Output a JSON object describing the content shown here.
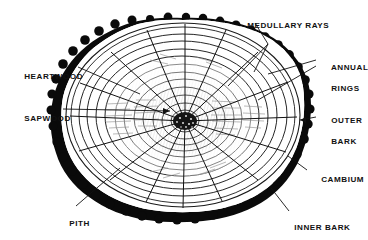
{
  "diagram": {
    "background_color": "#ffffff",
    "ink_color": "#111111",
    "bark_color": "#0a0a0a",
    "ring_color": "#1a1a1a",
    "texture_color": "#8a8a8a",
    "trunk": {
      "center_x": 183,
      "center_y": 115,
      "radius_x": 120,
      "radius_y": 95,
      "annual_ring_count": 11,
      "medullary_ray_count": 16
    }
  },
  "labels": {
    "medullary_rays": {
      "text": "MEDULLARY RAYS",
      "x": 236,
      "y": 10,
      "align": "left"
    },
    "annual_rings": {
      "line1": "ANNUAL",
      "line2": "RINGS",
      "x": 320,
      "y": 57,
      "align": "left"
    },
    "outer_bark": {
      "line1": "OUTER",
      "line2": "BARK",
      "x": 320,
      "y": 110,
      "align": "left"
    },
    "cambium": {
      "text": "CAMBIUM",
      "x": 310,
      "y": 167,
      "align": "left"
    },
    "inner_bark": {
      "text": "INNER BARK",
      "x": 283,
      "y": 216,
      "align": "left"
    },
    "heartwood": {
      "text": "HEARTWOOD",
      "x": 13,
      "y": 64,
      "align": "left"
    },
    "sapwood": {
      "text": "SAPWOOD",
      "x": 13,
      "y": 106,
      "align": "left"
    },
    "pith": {
      "text": "PITH",
      "x": 58,
      "y": 212,
      "align": "left"
    }
  }
}
